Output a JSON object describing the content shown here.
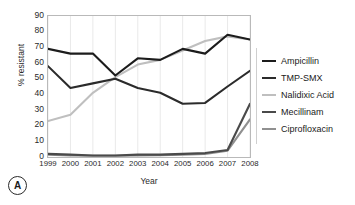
{
  "panel": {
    "label": "A"
  },
  "chart_data": {
    "type": "line",
    "title": "",
    "xlabel": "Year",
    "ylabel": "% resistant",
    "categories": [
      "1999",
      "2000",
      "2001",
      "2002",
      "2003",
      "2004",
      "2005",
      "2006",
      "2007",
      "2008"
    ],
    "x": [
      1999,
      2000,
      2001,
      2002,
      2003,
      2004,
      2005,
      2006,
      2007,
      2008
    ],
    "ylim": [
      0,
      90
    ],
    "yticks": [
      0,
      10,
      20,
      30,
      40,
      50,
      60,
      70,
      80,
      90
    ],
    "xlim": [
      1999,
      2008
    ],
    "grid": "vertical",
    "legend_position": "right",
    "series": [
      {
        "name": "Ampicillin",
        "color": "#1c1c1c",
        "width": 2.1,
        "values": [
          69,
          66,
          66,
          52,
          63,
          62,
          69,
          66,
          78,
          75
        ]
      },
      {
        "name": "TMP-SMX",
        "color": "#2b2b2b",
        "width": 2.1,
        "values": [
          58,
          44,
          47,
          50,
          44,
          41,
          34,
          34.5,
          45,
          55
        ]
      },
      {
        "name": "Nalidixic Acid",
        "color": "#bfbfbf",
        "width": 2.1,
        "values": [
          23,
          27,
          41,
          51,
          59,
          62,
          68,
          74,
          77,
          75
        ]
      },
      {
        "name": "Mecillinam",
        "color": "#4a4a4a",
        "width": 2.1,
        "values": [
          2,
          1.5,
          1,
          1,
          1.5,
          1.5,
          2,
          2.5,
          4.5,
          34
        ]
      },
      {
        "name": "Ciprofloxacin",
        "color": "#909090",
        "width": 2.1,
        "values": [
          1.5,
          1,
          0.8,
          0.8,
          1,
          1.2,
          1.5,
          2,
          4,
          24
        ]
      }
    ]
  },
  "style": {
    "plot_border": "#b9b9b9",
    "gridline": "#e9e9e9",
    "background": "#ffffff",
    "text": "#1a1a1a"
  }
}
